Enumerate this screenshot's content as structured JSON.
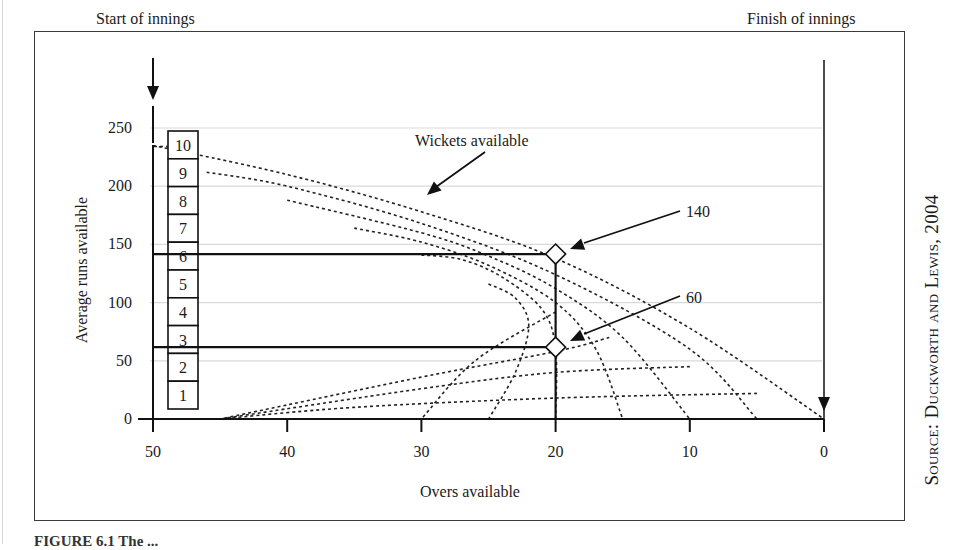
{
  "figure": {
    "source_label": "Source: Duckworth and Lewis, 2004",
    "caption_fragment": "FIGURE 6.1 The ..."
  },
  "chart_data": {
    "type": "line",
    "title": "",
    "xlabel": "Overs available",
    "ylabel": "Average runs available",
    "xlim": [
      50,
      0
    ],
    "ylim": [
      0,
      250
    ],
    "x_ticks": [
      "50",
      "40",
      "30",
      "20",
      "10",
      "0"
    ],
    "y_ticks": [
      "0",
      "50",
      "100",
      "150",
      "200",
      "250"
    ],
    "grid": "horizontal light lines at y ticks",
    "annotations": {
      "start": "Start of innings",
      "finish": "Finish of innings",
      "wickets": "Wickets available",
      "point_high": "140",
      "point_low": "60"
    },
    "wicket_boxes": [
      "10",
      "9",
      "8",
      "7",
      "6",
      "5",
      "4",
      "3",
      "2",
      "1"
    ],
    "series": [
      {
        "name": "10 wickets",
        "points": [
          [
            50,
            235
          ],
          [
            40,
            210
          ],
          [
            30,
            178
          ],
          [
            20,
            138
          ],
          [
            10,
            78
          ],
          [
            0,
            0
          ]
        ]
      },
      {
        "name": "9 wickets",
        "points": [
          [
            46,
            212
          ],
          [
            40,
            200
          ],
          [
            30,
            168
          ],
          [
            20,
            124
          ],
          [
            10,
            60
          ],
          [
            5,
            0
          ]
        ]
      },
      {
        "name": "8 wickets",
        "points": [
          [
            40,
            188
          ],
          [
            30,
            160
          ],
          [
            25,
            140
          ],
          [
            20,
            112
          ],
          [
            15,
            70
          ],
          [
            10,
            0
          ]
        ]
      },
      {
        "name": "7 wickets",
        "points": [
          [
            35,
            164
          ],
          [
            30,
            152
          ],
          [
            25,
            132
          ],
          [
            20,
            100
          ],
          [
            17,
            60
          ],
          [
            15,
            0
          ]
        ]
      },
      {
        "name": "6 wickets",
        "points": [
          [
            30,
            141
          ],
          [
            27,
            137
          ],
          [
            24,
            122
          ],
          [
            21,
            94
          ],
          [
            20,
            60
          ],
          [
            20,
            0
          ]
        ]
      },
      {
        "name": "5 wickets",
        "points": [
          [
            25,
            116
          ],
          [
            23,
            104
          ],
          [
            22,
            80
          ],
          [
            23,
            40
          ],
          [
            25,
            0
          ]
        ]
      },
      {
        "name": "4 wickets",
        "points": [
          [
            20,
            92
          ],
          [
            26,
            50
          ],
          [
            30,
            0
          ]
        ]
      },
      {
        "name": "3 wickets",
        "points": [
          [
            16,
            70
          ],
          [
            20,
            58
          ],
          [
            30,
            36
          ],
          [
            45,
            0
          ]
        ]
      },
      {
        "name": "2 wickets",
        "points": [
          [
            10,
            45
          ],
          [
            20,
            40
          ],
          [
            30,
            26
          ],
          [
            45,
            0
          ]
        ]
      },
      {
        "name": "1 wicket",
        "points": [
          [
            5,
            22
          ],
          [
            20,
            18
          ],
          [
            35,
            10
          ],
          [
            45,
            0
          ]
        ]
      }
    ],
    "highlight_points": [
      {
        "overs": 20,
        "runs": 140,
        "wickets": 6,
        "label": "140"
      },
      {
        "overs": 20,
        "runs": 60,
        "wickets": 3,
        "label": "60"
      }
    ]
  }
}
